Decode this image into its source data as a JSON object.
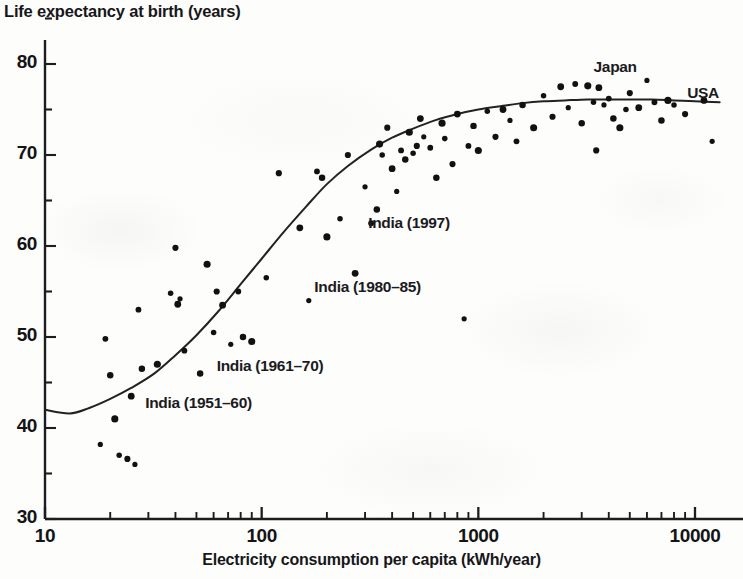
{
  "chart_data": {
    "type": "scatter",
    "title": "",
    "xlabel": "Electricity consumption per capita (kWh/year)",
    "ylabel": "Life expectancy at birth (years)",
    "x_scale": "log",
    "y_scale": "linear",
    "xlim": [
      10,
      13000
    ],
    "ylim": [
      30,
      83
    ],
    "grid": false,
    "legend": "none",
    "x_ticks": [
      {
        "value": 10,
        "label": "10"
      },
      {
        "value": 100,
        "label": "100"
      },
      {
        "value": 1000,
        "label": "1000"
      },
      {
        "value": 10000,
        "label": "10000"
      }
    ],
    "y_ticks": [
      {
        "value": 30,
        "label": "30"
      },
      {
        "value": 35,
        "label": ""
      },
      {
        "value": 40,
        "label": "40"
      },
      {
        "value": 45,
        "label": ""
      },
      {
        "value": 50,
        "label": "50"
      },
      {
        "value": 55,
        "label": ""
      },
      {
        "value": 60,
        "label": "60"
      },
      {
        "value": 65,
        "label": ""
      },
      {
        "value": 70,
        "label": "70"
      },
      {
        "value": 75,
        "label": ""
      },
      {
        "value": 80,
        "label": "80"
      }
    ],
    "series": [
      {
        "name": "Countries",
        "marker": "filled-circle",
        "color": "#111111",
        "points": [
          [
            18,
            38.2
          ],
          [
            19,
            49.8
          ],
          [
            20,
            45.8
          ],
          [
            21,
            41.0
          ],
          [
            22,
            37.0
          ],
          [
            24,
            36.6
          ],
          [
            25,
            43.5
          ],
          [
            26,
            36.0
          ],
          [
            27,
            53.0
          ],
          [
            28,
            46.5
          ],
          [
            33,
            47.0
          ],
          [
            38,
            54.8
          ],
          [
            40,
            59.8
          ],
          [
            41,
            53.6
          ],
          [
            42,
            54.2
          ],
          [
            44,
            48.5
          ],
          [
            52,
            46.0
          ],
          [
            56,
            58.0
          ],
          [
            60,
            50.5
          ],
          [
            62,
            55.0
          ],
          [
            66,
            53.5
          ],
          [
            72,
            49.2
          ],
          [
            78,
            55.0
          ],
          [
            82,
            50.0
          ],
          [
            90,
            49.5
          ],
          [
            105,
            56.5
          ],
          [
            120,
            68.0
          ],
          [
            150,
            62.0
          ],
          [
            165,
            54.0
          ],
          [
            180,
            68.2
          ],
          [
            190,
            67.5
          ],
          [
            200,
            61.0
          ],
          [
            230,
            63.0
          ],
          [
            250,
            70.0
          ],
          [
            270,
            57.0
          ],
          [
            300,
            66.5
          ],
          [
            320,
            62.5
          ],
          [
            340,
            64.0
          ],
          [
            350,
            71.2
          ],
          [
            360,
            70.0
          ],
          [
            380,
            73.0
          ],
          [
            400,
            68.5
          ],
          [
            420,
            66.0
          ],
          [
            440,
            70.5
          ],
          [
            460,
            69.5
          ],
          [
            480,
            72.5
          ],
          [
            500,
            70.2
          ],
          [
            520,
            71.0
          ],
          [
            540,
            74.0
          ],
          [
            560,
            72.0
          ],
          [
            600,
            70.8
          ],
          [
            640,
            67.5
          ],
          [
            680,
            73.5
          ],
          [
            700,
            71.8
          ],
          [
            760,
            69.0
          ],
          [
            800,
            74.5
          ],
          [
            860,
            52.0
          ],
          [
            900,
            71.0
          ],
          [
            950,
            73.2
          ],
          [
            1000,
            70.5
          ],
          [
            1100,
            74.8
          ],
          [
            1200,
            72.0
          ],
          [
            1300,
            75.0
          ],
          [
            1400,
            73.8
          ],
          [
            1500,
            71.5
          ],
          [
            1600,
            75.5
          ],
          [
            1800,
            73.0
          ],
          [
            2000,
            76.5
          ],
          [
            2200,
            74.2
          ],
          [
            2400,
            77.5
          ],
          [
            2600,
            75.2
          ],
          [
            2800,
            77.8
          ],
          [
            3000,
            73.5
          ],
          [
            3200,
            77.6
          ],
          [
            3400,
            75.8
          ],
          [
            3500,
            70.5
          ],
          [
            3600,
            77.4
          ],
          [
            3800,
            75.5
          ],
          [
            4000,
            76.2
          ],
          [
            4200,
            74.0
          ],
          [
            4500,
            73.0
          ],
          [
            4800,
            75.0
          ],
          [
            5000,
            76.8
          ],
          [
            5500,
            75.2
          ],
          [
            6000,
            78.2
          ],
          [
            6500,
            75.8
          ],
          [
            7000,
            73.8
          ],
          [
            7500,
            76.0
          ],
          [
            8000,
            75.5
          ],
          [
            9000,
            74.5
          ],
          [
            11000,
            76.0
          ],
          [
            12000,
            71.5
          ]
        ]
      }
    ],
    "trend_curve": {
      "name": "Fitted sigmoid trend",
      "color": "#222222",
      "description": "Saturating logistic curve rising from ~42 years at 10 kWh to ~76 years above 3000 kWh",
      "points": [
        [
          10,
          42.0
        ],
        [
          13,
          41.6
        ],
        [
          16,
          42.2
        ],
        [
          20,
          43.2
        ],
        [
          25,
          44.4
        ],
        [
          32,
          46.0
        ],
        [
          40,
          48.0
        ],
        [
          50,
          50.2
        ],
        [
          63,
          52.8
        ],
        [
          80,
          55.8
        ],
        [
          100,
          58.6
        ],
        [
          126,
          61.5
        ],
        [
          160,
          64.3
        ],
        [
          200,
          66.8
        ],
        [
          250,
          68.8
        ],
        [
          320,
          70.6
        ],
        [
          400,
          71.9
        ],
        [
          500,
          72.9
        ],
        [
          630,
          73.8
        ],
        [
          800,
          74.5
        ],
        [
          1000,
          75.0
        ],
        [
          1300,
          75.4
        ],
        [
          1600,
          75.7
        ],
        [
          2000,
          75.9
        ],
        [
          2500,
          76.0
        ],
        [
          3200,
          76.1
        ],
        [
          4000,
          76.1
        ],
        [
          5000,
          76.1
        ],
        [
          6300,
          76.1
        ],
        [
          8000,
          76.0
        ],
        [
          10000,
          75.9
        ],
        [
          13000,
          75.8
        ]
      ]
    },
    "annotations": [
      {
        "id": "india-1951-60",
        "text": "India (1951–60)",
        "x": 29,
        "y": 42.5
      },
      {
        "id": "india-1961-70",
        "text": "India (1961–70)",
        "x": 62,
        "y": 46.6
      },
      {
        "id": "india-1980-85",
        "text": "India (1980–85)",
        "x": 175,
        "y": 55.3
      },
      {
        "id": "india-1997",
        "text": "India (1997)",
        "x": 310,
        "y": 62.3
      },
      {
        "id": "japan",
        "text": "Japan",
        "x": 3400,
        "y": 79.5
      },
      {
        "id": "usa",
        "text": "USA",
        "x": 9200,
        "y": 76.6
      }
    ]
  }
}
